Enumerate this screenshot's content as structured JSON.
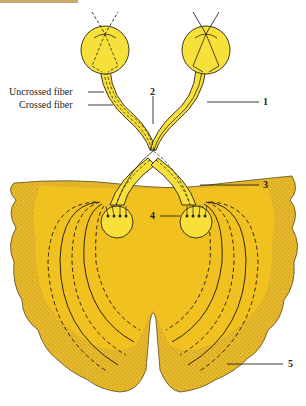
{
  "diagram": {
    "labels": {
      "uncrossed": "Uncrossed fiber",
      "crossed": "Crossed fiber",
      "n1": "1",
      "n2": "2",
      "n3": "3",
      "n4": "4",
      "n5": "5"
    },
    "colors": {
      "eye_yellow": "#f7e03a",
      "brain_gold": "#f1c21f",
      "cortex_stipple": "#d9ad2a",
      "outline": "#3a3020",
      "top_strip": "#c9a86a"
    }
  }
}
